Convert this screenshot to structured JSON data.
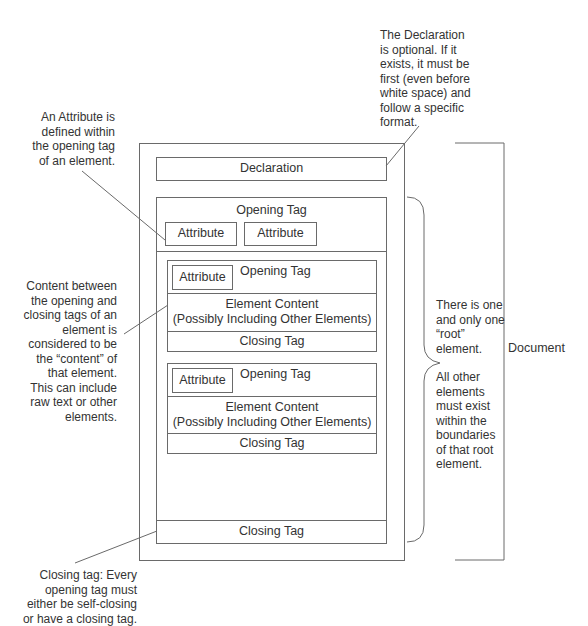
{
  "diagram": {
    "line_color": "#6a6a6a",
    "text_color": "#333333",
    "document": {
      "declaration_label": "Declaration",
      "root": {
        "opening_tag_label": "Opening Tag",
        "attributes": [
          "Attribute",
          "Attribute"
        ],
        "closing_tag_label": "Closing Tag",
        "children": [
          {
            "attribute_label": "Attribute",
            "opening_tag_label": "Opening Tag",
            "content_line1": "Element Content",
            "content_line2": "(Possibly Including Other Elements)",
            "closing_tag_label": "Closing Tag"
          },
          {
            "attribute_label": "Attribute",
            "opening_tag_label": "Opening Tag",
            "content_line1": "Element Content",
            "content_line2": "(Possibly Including Other Elements)",
            "closing_tag_label": "Closing Tag"
          }
        ]
      },
      "bracket_label": "Document"
    },
    "annotations": {
      "declaration": [
        "The Declaration",
        "is optional. If it",
        "exists, it must be",
        "first (even before",
        "white space) and",
        "follow a specific",
        "format."
      ],
      "attribute": [
        "An Attribute is",
        "defined within",
        "the opening tag",
        "of an element."
      ],
      "content": [
        "Content between",
        "the opening and",
        "closing tags of an",
        "element is",
        "considered to be",
        "the “content” of",
        "that element.",
        "This can include",
        "raw text or other",
        "elements."
      ],
      "root": [
        "There is one",
        "and only one",
        "“root”",
        "element."
      ],
      "other_elements": [
        "All other",
        "elements",
        "must exist",
        "within the",
        "boundaries",
        "of that root",
        "element."
      ],
      "closing_tag": [
        "Closing tag: Every",
        "opening tag must",
        "either be self-closing",
        "or have a closing tag."
      ]
    }
  }
}
